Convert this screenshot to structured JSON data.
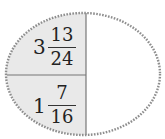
{
  "diagram": {
    "shape": "ellipse",
    "colors": {
      "shaded": "#e9e9e9",
      "unshaded": "#ffffff",
      "border": "#8e8e8e",
      "divider": "#777777"
    },
    "sections": [
      {
        "position": "top-left",
        "shaded": true,
        "whole": "3",
        "numerator": "13",
        "denominator": "24"
      },
      {
        "position": "bottom-left",
        "shaded": true,
        "whole": "1",
        "numerator": "7",
        "denominator": "16"
      },
      {
        "position": "right",
        "shaded": false,
        "label": ""
      }
    ]
  }
}
